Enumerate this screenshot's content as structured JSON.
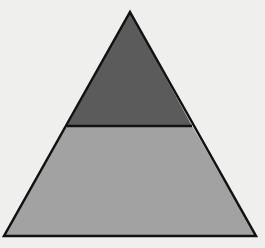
{
  "diagram": {
    "shape": "triangle",
    "background_color": "#efefed",
    "stroke_color": "#111111",
    "sections": [
      {
        "name": "top-section",
        "label": "",
        "fill_color": "#5b5b5b",
        "points": "130,12 67,126 192,126"
      },
      {
        "name": "bottom-section",
        "label": "",
        "fill_color": "#a2a2a2",
        "points": "67,126 192,126 256,236 4,236"
      }
    ],
    "outline_points": "130,12 256,236 4,236",
    "divider": {
      "x1": 67,
      "y1": 126,
      "x2": 192,
      "y2": 126
    }
  }
}
